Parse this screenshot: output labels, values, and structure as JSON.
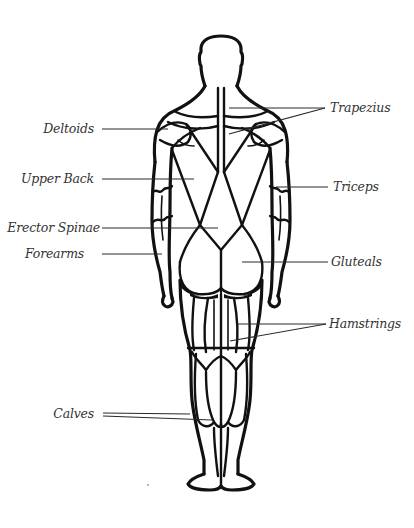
{
  "diagram": {
    "view": "back",
    "line_color": "#111111",
    "label_color": "#333333",
    "background": "#ffffff"
  },
  "labels": {
    "left": [
      {
        "id": "deltoids",
        "text": "Deltoids"
      },
      {
        "id": "upper_back",
        "text": "Upper Back"
      },
      {
        "id": "erector_spinae",
        "text": "Erector Spinae"
      },
      {
        "id": "forearms",
        "text": "Forearms"
      },
      {
        "id": "calves",
        "text": "Calves"
      }
    ],
    "right": [
      {
        "id": "trapezius",
        "text": "Trapezius"
      },
      {
        "id": "triceps",
        "text": "Triceps"
      },
      {
        "id": "gluteals",
        "text": "Gluteals"
      },
      {
        "id": "hamstrings",
        "text": "Hamstrings"
      }
    ]
  }
}
